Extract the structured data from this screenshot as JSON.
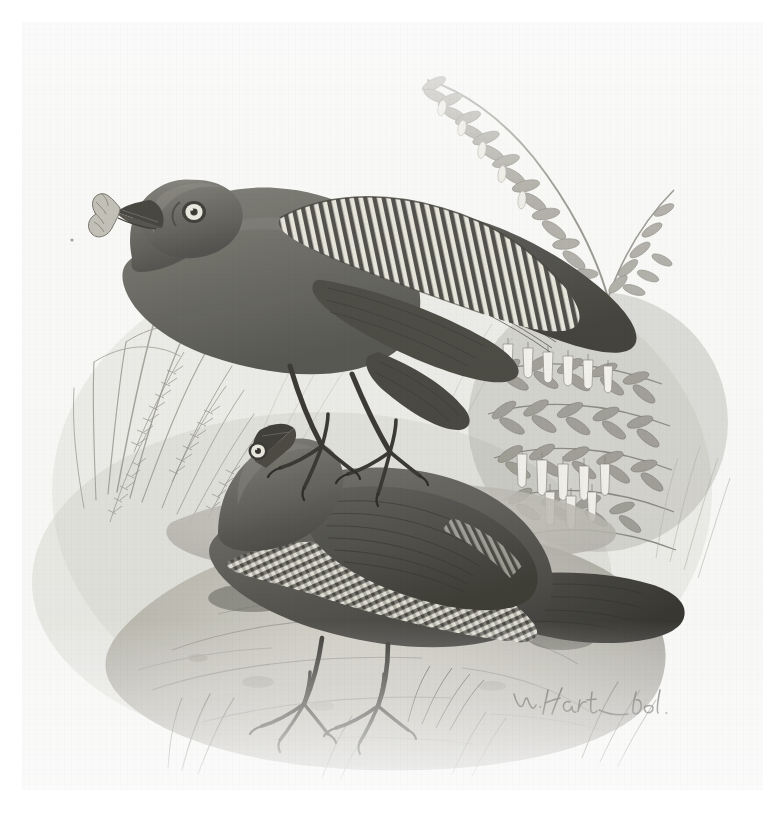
{
  "page": {
    "background_color": "#ffffff",
    "plate_background_color": "#fcfcfb",
    "scan_width": 784,
    "scan_height": 823
  },
  "plate": {
    "medium": "hand-coloured lithograph",
    "artist_signature": "W. Hart del.",
    "signature_position": "lower right of plate",
    "description": "Two dark plumaged birds with pale irises and boldly barred wings and underparts, perched on rocky ground amid grasses and flowering shrubs",
    "ink_color": "#3a3a38",
    "plumage_color": "#55544d",
    "plumage_dark_color": "#2b2a26",
    "bar_light_color": "#e8e6dc",
    "rock_color": "#b9b7ad",
    "foliage_color": "#8e8c82",
    "flower_color": "#f4f2ea"
  },
  "subjects": [
    {
      "id": "upper-bird",
      "label": "Upper bird, standing with caterpillar in bill",
      "posture": "standing, head raised, wing folded showing barred primaries",
      "eye": "pale white iris with dark pupil",
      "holding": "caterpillar"
    },
    {
      "id": "lower-bird",
      "label": "Lower bird, crouched on rock",
      "posture": "crouched low, long rounded dark tail extended to the right",
      "eye": "pale white iris with dark pupil",
      "markings": "strongly barred breast, flank and undertail"
    }
  ],
  "vegetation": [
    {
      "id": "grass-tufts-left",
      "label": "Grass tufts and fern fronds at left"
    },
    {
      "id": "flowering-branch-upper-right",
      "label": "Arching leafy flowering branch, upper right"
    },
    {
      "id": "pendulous-flowers-right",
      "label": "Pendulous white tubular flowers at right"
    },
    {
      "id": "ground-rock",
      "label": "Rocky ground and stones"
    }
  ],
  "caption": {
    "line": "Printed caption, illegible at this resolution",
    "parts": [
      "",
      "",
      ""
    ]
  }
}
